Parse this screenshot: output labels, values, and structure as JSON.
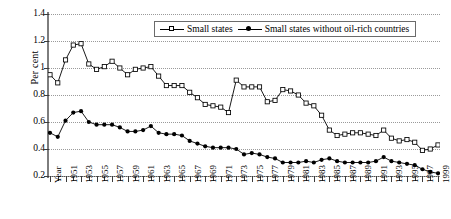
{
  "chart_data": {
    "type": "line",
    "title": "",
    "xlabel": "Year",
    "ylabel": "Per cent",
    "ylim": [
      0.2,
      1.4
    ],
    "yticks": [
      "1.4",
      "1.2",
      "1",
      "0.8",
      "0.6",
      "0.4",
      "0.2"
    ],
    "grid": true,
    "legend_position": "top-center",
    "x": [
      1949,
      1950,
      1951,
      1952,
      1953,
      1954,
      1955,
      1956,
      1957,
      1958,
      1959,
      1960,
      1961,
      1962,
      1963,
      1964,
      1965,
      1966,
      1967,
      1968,
      1969,
      1970,
      1971,
      1972,
      1973,
      1974,
      1975,
      1976,
      1977,
      1978,
      1979,
      1980,
      1981,
      1982,
      1983,
      1984,
      1985,
      1986,
      1987,
      1988,
      1989,
      1990,
      1991,
      1992,
      1993,
      1994,
      1995,
      1996,
      1997,
      1998,
      1999
    ],
    "xtick_labels": [
      "Year",
      "1951",
      "1953",
      "1955",
      "1957",
      "1959",
      "1961",
      "1963",
      "1965",
      "1967",
      "1969",
      "1971",
      "1973",
      "1975",
      "1977",
      "1979",
      "1981",
      "1983",
      "1985",
      "1987",
      "1989",
      "1991",
      "1993",
      "1995",
      "1997",
      "1999"
    ],
    "series": [
      {
        "name": "Small states",
        "marker": "open-square",
        "values": [
          0.95,
          0.89,
          1.06,
          1.17,
          1.18,
          1.03,
          0.99,
          1.01,
          1.05,
          1.0,
          0.95,
          0.99,
          1.0,
          1.01,
          0.94,
          0.87,
          0.87,
          0.87,
          0.82,
          0.78,
          0.73,
          0.72,
          0.71,
          0.67,
          0.91,
          0.86,
          0.86,
          0.86,
          0.75,
          0.76,
          0.84,
          0.83,
          0.8,
          0.74,
          0.72,
          0.65,
          0.54,
          0.5,
          0.51,
          0.52,
          0.52,
          0.51,
          0.5,
          0.54,
          0.48,
          0.46,
          0.47,
          0.45,
          0.39,
          0.4,
          0.43
        ]
      },
      {
        "name": "Small states without oil-rich countries",
        "marker": "filled-circle",
        "values": [
          0.52,
          0.49,
          0.61,
          0.67,
          0.68,
          0.6,
          0.58,
          0.58,
          0.58,
          0.56,
          0.53,
          0.53,
          0.54,
          0.57,
          0.52,
          0.51,
          0.51,
          0.5,
          0.46,
          0.44,
          0.42,
          0.41,
          0.41,
          0.41,
          0.4,
          0.36,
          0.37,
          0.36,
          0.34,
          0.33,
          0.3,
          0.3,
          0.3,
          0.31,
          0.3,
          0.32,
          0.33,
          0.31,
          0.3,
          0.3,
          0.3,
          0.3,
          0.31,
          0.34,
          0.31,
          0.3,
          0.29,
          0.28,
          0.25,
          0.23,
          0.22
        ]
      }
    ]
  },
  "legend": {
    "items": [
      {
        "label": "Small states",
        "marker": "open-square"
      },
      {
        "label": "Small states without oil-rich countries",
        "marker": "filled-circle"
      }
    ]
  },
  "axis": {
    "y_label": "Per cent",
    "y_ticks": [
      "1.4",
      "1.2",
      "1",
      "0.8",
      "0.6",
      "0.4",
      "0.2"
    ]
  },
  "colors": {
    "line": "#000000",
    "grid": "#9a9a9a",
    "axis": "#7d7d7d",
    "background": "#ffffff"
  }
}
